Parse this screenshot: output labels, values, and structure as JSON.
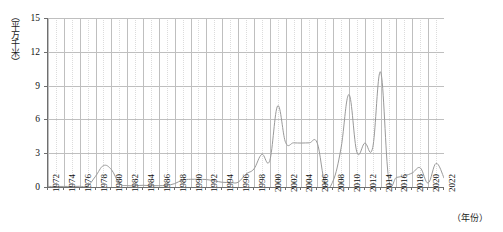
{
  "chart_data": {
    "type": "line",
    "title": "",
    "subtitle": "",
    "xlabel": "（年份）",
    "ylabel": "（平方千米）",
    "xlim": [
      1972,
      2022
    ],
    "ylim": [
      0,
      15
    ],
    "yticks": [
      0,
      3,
      6,
      9,
      12,
      15
    ],
    "ytick_labels": [
      "0",
      "3",
      "6",
      "9",
      "12",
      "15"
    ],
    "xticks": [
      1972,
      1974,
      1976,
      1978,
      1980,
      1982,
      1984,
      1986,
      1988,
      1990,
      1992,
      1994,
      1996,
      1998,
      2000,
      2002,
      2004,
      2006,
      2008,
      2010,
      2012,
      2014,
      2016,
      2018,
      2020,
      2022
    ],
    "xtick_labels": [
      "1972",
      "1974",
      "1976",
      "1978",
      "1980",
      "1982",
      "1984",
      "1986",
      "1988",
      "1990",
      "1992",
      "1994",
      "1996",
      "1998",
      "2000",
      "2002",
      "2004",
      "2006",
      "2008",
      "2010",
      "2012",
      "2014",
      "2016",
      "2018",
      "2020",
      "2022"
    ],
    "minor_x_gridlines": true,
    "grid": true,
    "legend": "none",
    "line_color": "#9a9a9a",
    "grid_color": "#bfbfbf",
    "minor_grid_color": "#dcdcdc",
    "axis_color": "#6f6f6f",
    "x": [
      1972,
      1973,
      1974,
      1975,
      1976,
      1977,
      1978,
      1979,
      1980,
      1981,
      1982,
      1983,
      1984,
      1985,
      1986,
      1987,
      1988,
      1989,
      1990,
      1991,
      1992,
      1993,
      1994,
      1995,
      1996,
      1997,
      1998,
      1999,
      2000,
      2001,
      2002,
      2003,
      2004,
      2005,
      2006,
      2007,
      2008,
      2009,
      2010,
      2011,
      2012,
      2013,
      2014,
      2015,
      2016,
      2017,
      2018,
      2019,
      2020,
      2021,
      2022
    ],
    "values": [
      0.05,
      0.05,
      0.05,
      0.05,
      0.06,
      0.1,
      0.95,
      1.9,
      1.55,
      0.32,
      0.12,
      0.12,
      0.15,
      0.12,
      0.12,
      0.15,
      0.3,
      0.62,
      0.68,
      0.68,
      0.66,
      0.55,
      0.42,
      0.4,
      0.42,
      1.15,
      1.6,
      2.9,
      2.35,
      7.2,
      3.95,
      3.92,
      3.9,
      3.92,
      3.9,
      0.22,
      0.55,
      3.45,
      8.2,
      3.1,
      3.9,
      3.5,
      10.2,
      0.8,
      0.85,
      1.0,
      1.25,
      1.7,
      0.35,
      2.1,
      0.8
    ],
    "series_name": "面积"
  }
}
